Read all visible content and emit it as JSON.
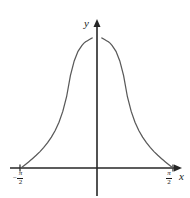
{
  "figure": {
    "background_color": "#ffffff",
    "ink_color": "#262626",
    "curve_color": "#595959",
    "axis_label_x": "x",
    "axis_label_y": "y"
  },
  "ticks": {
    "left": {
      "minus": "−",
      "numerator": "π",
      "denominator": "2"
    },
    "right": {
      "minus": "",
      "numerator": "π",
      "denominator": "2"
    }
  },
  "chart_data": {
    "type": "line",
    "title": "",
    "xlabel": "x",
    "ylabel": "y",
    "grid": false,
    "legend": "none",
    "xlim": [
      -1.6493361431346414,
      1.6493361431346414
    ],
    "ylim": [
      -0.29,
      3.42
    ],
    "xticks": [
      -1.5707963267948966,
      1.5707963267948966
    ],
    "xticklabels": [
      "−π/2",
      "π/2"
    ],
    "yticks": [],
    "yticklabels": [],
    "asymptotes": {
      "vertical": [
        0.0
      ],
      "horizontal": []
    },
    "series": [
      {
        "name": "left-branch",
        "x": [
          -1.5707963267948966,
          -1.5315264192491156,
          -1.4922565117033348,
          -1.4529866041575537,
          -1.413716696611773,
          -1.374446789065992,
          -1.335176881520211,
          -1.29590697397443,
          -1.2566370614359172,
          -1.1780972450961724,
          -1.0995574287564276,
          -1.0210176124166828,
          -0.9424777960769379,
          -0.8639379797371932,
          -0.7853981633974483,
          -0.7068583470577035,
          -0.6283185307179586,
          -0.5497787143782138,
          -0.47123889803846897,
          -0.39269908169872414,
          -0.3141592653589793,
          -0.2748893571891069,
          -0.23561944901923448,
          -0.19634954084936207,
          -0.15707963267948966,
          -0.13744467890659942,
          -0.11780972450961724,
          -0.09817477042468103
        ],
        "y": [
          0.0,
          0.0393,
          0.0789,
          0.119,
          0.1596,
          0.2011,
          0.2437,
          0.2875,
          0.3329,
          0.4295,
          0.5376,
          0.6613,
          0.8063,
          0.9811,
          1.1989,
          1.4806,
          1.8637,
          2.4142,
          2.8,
          3.05,
          3.2,
          3.26,
          3.3,
          3.33,
          3.36,
          3.375,
          3.39,
          3.4
        ],
        "color": "#595959"
      },
      {
        "name": "right-branch",
        "x": [
          1.5707963267948966,
          1.5315264192491156,
          1.4922565117033348,
          1.4529866041575537,
          1.413716696611773,
          1.374446789065992,
          1.335176881520211,
          1.29590697397443,
          1.2566370614359172,
          1.1780972450961724,
          1.0995574287564276,
          1.0210176124166828,
          0.9424777960769379,
          0.8639379797371932,
          0.7853981633974483,
          0.7068583470577035,
          0.6283185307179586,
          0.5497787143782138,
          0.47123889803846897,
          0.39269908169872414,
          0.3141592653589793,
          0.2748893571891069,
          0.23561944901923448,
          0.19634954084936207,
          0.15707963267948966,
          0.13744467890659942,
          0.11780972450961724,
          0.09817477042468103
        ],
        "y": [
          0.0,
          0.0393,
          0.0789,
          0.119,
          0.1596,
          0.2011,
          0.2437,
          0.2875,
          0.3329,
          0.4295,
          0.5376,
          0.6613,
          0.8063,
          0.9811,
          1.1989,
          1.4806,
          1.8637,
          2.4142,
          2.8,
          3.05,
          3.2,
          3.26,
          3.3,
          3.33,
          3.36,
          3.375,
          3.39,
          3.4
        ],
        "color": "#595959"
      }
    ]
  }
}
